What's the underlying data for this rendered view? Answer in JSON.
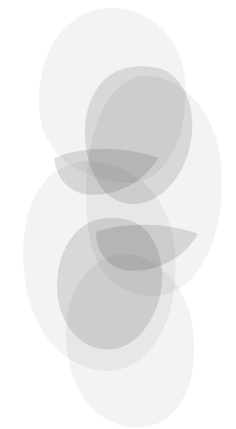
{
  "canvas": {
    "width": 236,
    "height": 429,
    "background_color": "#ffffff",
    "description": "Abstract grayscale composition of overlapping translucent organic blob shapes"
  },
  "palette": {
    "background": "#ffffff",
    "pale_blob_fill": "#eeeeee",
    "pale_blob_overlap": "#e4e4e4",
    "dark_lobe_fill": "#d2d2d2",
    "dark_lens_overlap": "#c4c4c4",
    "deepest_overlap": "#bdbdbd"
  },
  "shapes": [
    {
      "name": "pale-blob-top",
      "role": "background-blob",
      "tone": "pale",
      "fill": "#eeeeee",
      "opacity": 0.72,
      "center_x": 112,
      "center_y": 92,
      "radius_x": 72,
      "radius_y": 86,
      "bounds": [
        40,
        8,
        185,
        180
      ]
    },
    {
      "name": "pale-blob-right",
      "role": "background-blob",
      "tone": "pale",
      "fill": "#eeeeee",
      "opacity": 0.72,
      "center_x": 150,
      "center_y": 196,
      "radius_x": 66,
      "radius_y": 92,
      "bounds": [
        84,
        76,
        222,
        300
      ]
    },
    {
      "name": "pale-blob-left",
      "role": "background-blob",
      "tone": "pale",
      "fill": "#eeeeee",
      "opacity": 0.72,
      "center_x": 96,
      "center_y": 268,
      "radius_x": 74,
      "radius_y": 96,
      "bounds": [
        20,
        160,
        176,
        370
      ]
    },
    {
      "name": "pale-blob-bottom",
      "role": "background-blob",
      "tone": "pale",
      "fill": "#eeeeee",
      "opacity": 0.72,
      "center_x": 126,
      "center_y": 340,
      "radius_x": 62,
      "radius_y": 82,
      "bounds": [
        60,
        252,
        196,
        424
      ]
    },
    {
      "name": "dark-lobe-upper",
      "role": "foreground-lobe",
      "tone": "dark",
      "fill": "#d2d2d2",
      "opacity": 0.62,
      "center_x": 136,
      "center_y": 135,
      "radius_x": 54,
      "radius_y": 68,
      "rotation_deg": -28,
      "bounds": [
        80,
        66,
        195,
        210
      ]
    },
    {
      "name": "dark-lobe-lower",
      "role": "foreground-lobe",
      "tone": "dark",
      "fill": "#d2d2d2",
      "opacity": 0.62,
      "center_x": 106,
      "center_y": 285,
      "radius_x": 52,
      "radius_y": 66,
      "rotation_deg": -24,
      "bounds": [
        54,
        218,
        166,
        352
      ]
    },
    {
      "name": "dark-lens-upper",
      "role": "intersection-lens",
      "tone": "dark",
      "fill": "#cccccc",
      "opacity": 0.58,
      "center_x": 112,
      "center_y": 172,
      "radius_x": 60,
      "radius_y": 26,
      "rotation_deg": -16,
      "bounds": [
        52,
        144,
        172,
        200
      ]
    },
    {
      "name": "dark-lens-lower",
      "role": "intersection-lens",
      "tone": "dark",
      "fill": "#cccccc",
      "opacity": 0.58,
      "center_x": 148,
      "center_y": 248,
      "radius_x": 54,
      "radius_y": 26,
      "rotation_deg": -14,
      "bounds": [
        94,
        220,
        202,
        276
      ]
    }
  ]
}
